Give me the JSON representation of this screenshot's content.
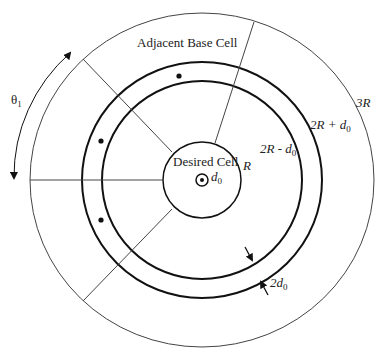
{
  "diagram": {
    "title_label": "Adjacent Base Cell",
    "center_label": "Desired Cell",
    "angle_label": {
      "symbol": "θ",
      "sub": "1"
    },
    "radius_labels": {
      "r": "R",
      "inner_ring": {
        "main": "2R - d",
        "sub": "0"
      },
      "outer_ring": {
        "main": "2R + d",
        "sub": "0"
      },
      "outer": "3R"
    },
    "center_offset_label": {
      "main": "d",
      "sub": "0"
    },
    "ring_width_label": {
      "main": "2d",
      "sub": "0"
    },
    "geometry": {
      "center": [
        202,
        180
      ],
      "radii_x": {
        "R": 39,
        "inner_ring": 100,
        "outer_ring": 120,
        "outer": 172
      },
      "radii_y": {
        "R": 38,
        "inner_ring": 99,
        "outer_ring": 118,
        "outer": 167
      }
    },
    "colors": {
      "stroke": "#111111",
      "thin_stroke": "#444444",
      "text": "#222222",
      "background": "#ffffff"
    }
  }
}
